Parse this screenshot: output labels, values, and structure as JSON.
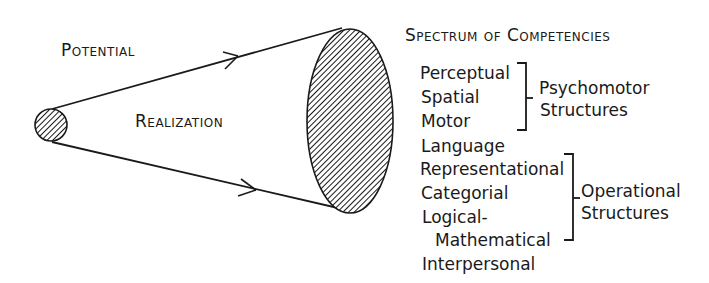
{
  "diagram": {
    "cone_labels": {
      "potential": "Potential",
      "realization": "Realization"
    },
    "spectrum": {
      "title": "Spectrum of Competencies",
      "items": [
        "Perceptual",
        "Spatial",
        "Motor",
        "Language",
        "Representational",
        "Categorial",
        "Logical-",
        "Mathematical",
        "Interpersonal"
      ],
      "groups": [
        {
          "label_line1": "Psychomotor",
          "label_line2": "Structures",
          "covers": [
            "Perceptual",
            "Spatial",
            "Motor"
          ]
        },
        {
          "label_line1": "Operational",
          "label_line2": "Structures",
          "covers": [
            "Representational",
            "Categorial",
            "Logical-Mathematical"
          ]
        }
      ]
    },
    "colors": {
      "ink": "#1a1a1a",
      "background": "#ffffff"
    }
  }
}
